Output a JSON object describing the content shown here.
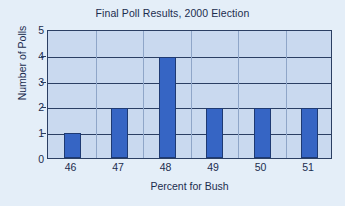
{
  "chart_data": {
    "type": "bar",
    "title": "Final Poll Results, 2000 Election",
    "xlabel": "Percent for Bush",
    "ylabel": "Number of Polls",
    "categories": [
      "46",
      "47",
      "48",
      "49",
      "50",
      "51"
    ],
    "values": [
      1,
      2,
      4,
      2,
      2,
      2
    ],
    "series": [
      {
        "name": "Number of Polls",
        "values": [
          1,
          2,
          4,
          2,
          2,
          2
        ]
      }
    ],
    "ylim": [
      0,
      5
    ],
    "y_ticks": [
      "0",
      "1",
      "2",
      "3",
      "4",
      "5"
    ],
    "x_ticks": [
      "46",
      "47",
      "48",
      "49",
      "50",
      "51"
    ],
    "grid": "horizontal-and-vertical",
    "legend": "none",
    "colors": {
      "bar_fill": "#3665c4",
      "bar_border": "#1e3a73",
      "plot_background": "#c9d9ef",
      "figure_background": "#e4eef8",
      "axis_line": "#2b3f63",
      "gridline_vertical": "#8fa6c8",
      "text": "#1b2c4e"
    }
  }
}
